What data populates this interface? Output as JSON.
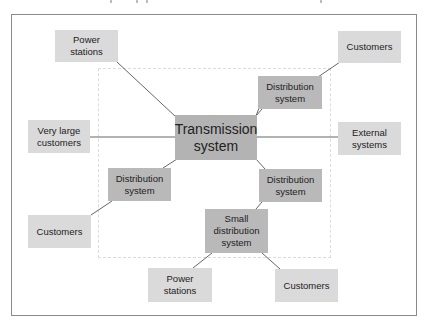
{
  "diagram": {
    "central": {
      "label": "Transmission system",
      "line1": "Transmission",
      "line2": "system"
    },
    "nodes": {
      "power_stations_top": {
        "line1": "Power",
        "line2": "stations"
      },
      "customers_top_right": {
        "line1": "Customers"
      },
      "distribution_top_right": {
        "line1": "Distribution",
        "line2": "system"
      },
      "very_large_customers": {
        "line1": "Very large",
        "line2": "customers"
      },
      "external_systems": {
        "line1": "External",
        "line2": "systems"
      },
      "distribution_left": {
        "line1": "Distribution",
        "line2": "system"
      },
      "customers_left": {
        "line1": "Customers"
      },
      "distribution_bottom_right": {
        "line1": "Distribution",
        "line2": "system"
      },
      "small_distribution": {
        "line1": "Small",
        "line2": "distribution",
        "line3": "system"
      },
      "power_stations_bottom": {
        "line1": "Power",
        "line2": "stations"
      },
      "customers_bottom": {
        "line1": "Customers"
      }
    },
    "colors": {
      "leaf_fill": "#dadada",
      "mid_fill": "#b9b9b9",
      "core_fill": "#b3b3b3",
      "line": "#555555",
      "frame": "#8a8a8a",
      "dashed": "#dcdcdc"
    }
  }
}
